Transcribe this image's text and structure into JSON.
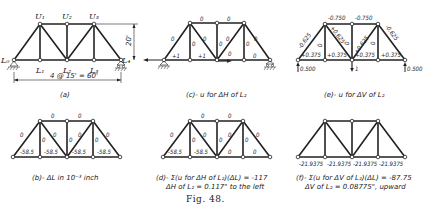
{
  "figure": {
    "number_label": "Fig. 48.",
    "panels": {
      "a": {
        "caption": "(a)",
        "nodes": {
          "L0": "L₀",
          "L1": "L₁",
          "L2": "L₂",
          "L3": "L₃",
          "L4": "L₄",
          "U1": "U₁",
          "U2": "U₂",
          "U3": "U₃"
        },
        "span_dimension": "4 @ 15' = 60'",
        "height_dimension": "20'"
      },
      "b": {
        "caption": "(b)- ΔL in 10⁻³ inch",
        "members": {
          "U1U2": "0",
          "U2U3": "0",
          "L0U1": "0",
          "U1L1": "0",
          "U1L2": "0",
          "U2L2": "0",
          "L2U3": "0",
          "U3L3": "0",
          "U3L4": "0",
          "L0L1": "-58.5",
          "L1L2": "-58.5",
          "L2L3": "-58.5",
          "L3L4": "-58.5"
        }
      },
      "c": {
        "caption": "(c)- u for ΔH of L₂",
        "members": {
          "U1U2": "0",
          "U2U3": "0",
          "L0U1": "0",
          "U1L1": "0",
          "U1L2": "0",
          "U2L2": "0",
          "L2U3": "0",
          "U3L3": "0",
          "U3L4": "0",
          "L0L1": "+1",
          "L1L2": "+1",
          "L2L3": "0",
          "L3L4": "0"
        }
      },
      "d": {
        "caption_line1": "(d)- Σ(u for ΔH of L₂)(ΔL) = -117",
        "caption_line2": "ΔH of L₂ = 0.117\" to the left",
        "members": {
          "U1U2": "0",
          "U2U3": "0",
          "L0U1": "0",
          "U1L1": "0",
          "U1L2": "0",
          "U2L2": "0",
          "L2U3": "0",
          "U3L3": "0",
          "U3L4": "0",
          "L0L1": "-58.5",
          "L1L2": "-58.5",
          "L2L3": "0",
          "L3L4": "0"
        }
      },
      "e": {
        "caption": "(e)- u for ΔV of L₂",
        "members": {
          "U1U2": "-0.750",
          "U2U3": "-0.750",
          "L0U1": "-0.625",
          "U1L1": "0",
          "U1L2": "+0.625",
          "U2L2": "0",
          "L2U3": "+0.625",
          "U3L3": "0",
          "U3L4": "-0.625",
          "L0L1": "+0.375",
          "L1L2": "+0.375",
          "L2L3": "+0.375",
          "L3L4": "+0.375"
        },
        "reaction_left": "0.500",
        "reaction_right": "0.500",
        "load": "1"
      },
      "f": {
        "caption_line1": "(f)- Σ(u for ΔV of L₂)(ΔL) = -87.75",
        "caption_line2": "ΔV of L₂ = 0.08775\", upward",
        "members": {
          "L0L1": "-21.9375",
          "L1L2": "-21.9375",
          "L2L3": "-21.9375",
          "L3L4": "-21.9375"
        }
      }
    }
  }
}
